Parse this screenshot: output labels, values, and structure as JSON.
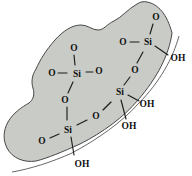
{
  "diagram": {
    "background": "#ffffff",
    "particle_fill": "#c9cbc7",
    "particle_stroke": "#474747",
    "surface_line_color": "#565656",
    "bond_color": "#1c1c1c",
    "label_color": "#101010"
  },
  "labels": [
    {
      "name": "oxygen-above-center-si",
      "text": "O"
    },
    {
      "name": "oxygen-left-of-center-si",
      "text": "O"
    },
    {
      "name": "center-silicon",
      "text": "Si"
    },
    {
      "name": "oxygen-right-of-center-si",
      "text": "O"
    },
    {
      "name": "oxygen-below-center-si",
      "text": "O"
    },
    {
      "name": "bottom-left-silicon",
      "text": "Si"
    },
    {
      "name": "oxygen-left-of-bottom-si",
      "text": "O"
    },
    {
      "name": "hydroxyl-bottom",
      "text": "OH"
    },
    {
      "name": "bridging-oxygen-middle",
      "text": "O"
    },
    {
      "name": "middle-right-silicon",
      "text": "Si"
    },
    {
      "name": "hydroxyl-middle-right-upper",
      "text": "OH"
    },
    {
      "name": "hydroxyl-middle-right-lower",
      "text": "OH"
    },
    {
      "name": "bridging-oxygen-upper-right",
      "text": "O"
    },
    {
      "name": "top-right-silicon",
      "text": "Si"
    },
    {
      "name": "oxygen-left-of-top-right-si",
      "text": "O"
    },
    {
      "name": "oxygen-above-top-right-si",
      "text": "O"
    },
    {
      "name": "hydroxyl-top-right",
      "text": "OH"
    }
  ]
}
